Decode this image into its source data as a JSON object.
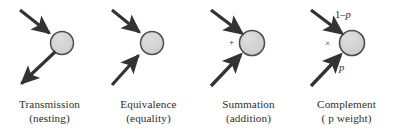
{
  "figure": {
    "background_color": "#ffffff",
    "node_fill_color": "#d4d4d4",
    "node_stroke_color": "#4a4a4a",
    "arrow_color": "#333333",
    "text_color": "#2b2b2b",
    "panels": [
      {
        "id": "transmission",
        "caption_line1": "Transmission",
        "caption_line2": "(nesting)",
        "node": {
          "cx": 62,
          "cy": 43,
          "r": 11.5
        },
        "arrows": [
          {
            "name": "incoming-arrow-upper-left",
            "x1": 20,
            "y1": 10,
            "x2": 53,
            "y2": 36,
            "direction": "in"
          },
          {
            "name": "outgoing-arrow-lower-left",
            "x1": 54,
            "y1": 52,
            "x2": 18,
            "y2": 86,
            "direction": "out"
          }
        ],
        "annotations": []
      },
      {
        "id": "equivalence",
        "caption_line1": "Equivalence",
        "caption_line2": "(equality)",
        "node": {
          "cx": 152,
          "cy": 43,
          "r": 11.5
        },
        "arrows": [
          {
            "name": "incoming-arrow-upper-left",
            "x1": 112,
            "y1": 10,
            "x2": 143,
            "y2": 35,
            "direction": "in"
          },
          {
            "name": "incoming-arrow-lower-left",
            "x1": 112,
            "y1": 86,
            "x2": 142,
            "y2": 53,
            "direction": "in"
          }
        ],
        "annotations": []
      },
      {
        "id": "summation",
        "caption_line1": "Summation",
        "caption_line2": "(addition)",
        "node": {
          "cx": 252,
          "cy": 43,
          "r": 12.5
        },
        "arrows": [
          {
            "name": "incoming-arrow-upper-left",
            "x1": 211,
            "y1": 10,
            "x2": 243,
            "y2": 34,
            "direction": "in"
          },
          {
            "name": "incoming-arrow-lower-left",
            "x1": 211,
            "y1": 86,
            "x2": 242,
            "y2": 54,
            "direction": "in"
          }
        ],
        "annotations": [
          {
            "name": "plus-operator-label",
            "text": "+",
            "x": 230,
            "y": 40,
            "style": "op"
          }
        ]
      },
      {
        "id": "complement",
        "caption_line1": "Complement",
        "caption_line2_prefix": "( ",
        "caption_line2_symbol": "p",
        "caption_line2_suffix": " weight)",
        "node": {
          "cx": 352,
          "cy": 43,
          "r": 12.5
        },
        "arrows": [
          {
            "name": "incoming-arrow-upper-left",
            "x1": 311,
            "y1": 10,
            "x2": 343,
            "y2": 34,
            "direction": "in"
          },
          {
            "name": "incoming-arrow-lower-left",
            "x1": 311,
            "y1": 86,
            "x2": 342,
            "y2": 54,
            "direction": "in"
          }
        ],
        "annotations": [
          {
            "name": "one-minus-p-weight-label",
            "text": "1–p",
            "x": 337,
            "y": 12,
            "style": "plain"
          },
          {
            "name": "times-operator-label",
            "text": "×",
            "x": 326,
            "y": 40,
            "style": "op"
          },
          {
            "name": "p-weight-label",
            "text": "p",
            "x": 340,
            "y": 65,
            "style": "plain"
          }
        ]
      }
    ]
  }
}
